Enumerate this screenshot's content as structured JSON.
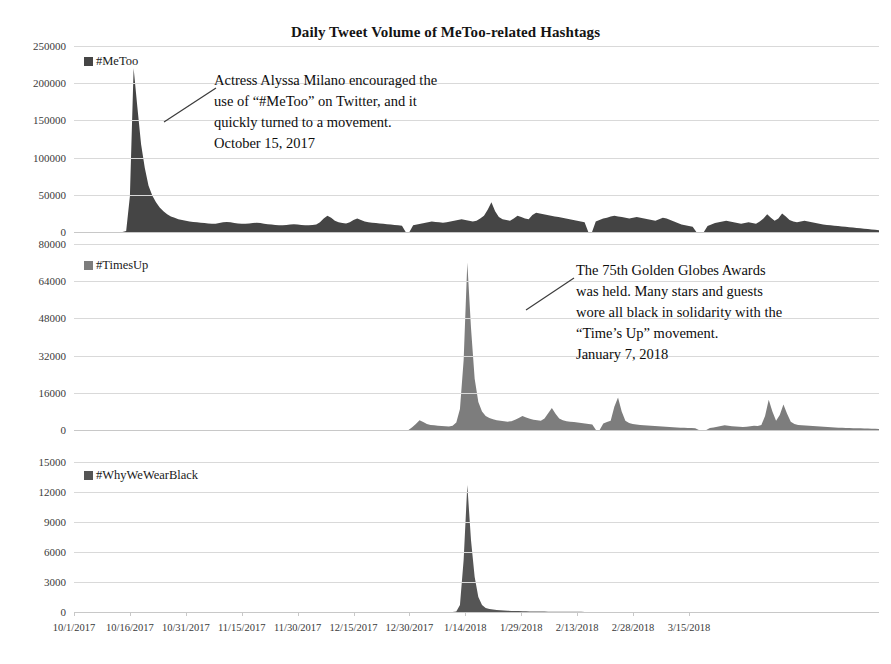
{
  "chart_data": {
    "type": "area",
    "title": "Daily Tweet Volume of MeToo-related Hashtags",
    "xlabel": "",
    "ylabel": "",
    "grid": true,
    "legend_position": "inside-top-left",
    "x_tick_labels": [
      "10/1/2017",
      "10/16/2017",
      "10/31/2017",
      "11/15/2017",
      "11/30/2017",
      "12/15/2017",
      "12/30/2017",
      "1/14/2018",
      "1/29/2018",
      "2/13/2018",
      "2/28/2018",
      "3/15/2018"
    ],
    "x_range": [
      "10/1/2017",
      "3/22/2018"
    ],
    "panels": [
      {
        "name": "#MeToo",
        "legend_label": "#MeToo",
        "color": "#454545",
        "ylim": [
          0,
          250000
        ],
        "y_tick_labels": [
          "250000",
          "200000",
          "150000",
          "100000",
          "50000",
          "0"
        ],
        "y_tick_values": [
          250000,
          200000,
          150000,
          100000,
          50000,
          0
        ],
        "peak_value": 220000,
        "peak_date": "10/16/2017",
        "values": [
          0,
          0,
          0,
          0,
          0,
          0,
          0,
          0,
          0,
          0,
          0,
          0,
          0,
          0,
          1500,
          48000,
          220000,
          168000,
          118000,
          86000,
          62000,
          49000,
          40000,
          33000,
          28000,
          24000,
          21000,
          19000,
          17000,
          16000,
          15000,
          14000,
          13500,
          13000,
          12500,
          12000,
          11500,
          11000,
          11000,
          12000,
          13000,
          13500,
          13000,
          12000,
          11500,
          11000,
          11000,
          11500,
          12000,
          12500,
          12000,
          11000,
          10500,
          10000,
          9500,
          9000,
          9000,
          9500,
          10000,
          10500,
          10000,
          9500,
          9000,
          9000,
          9500,
          10000,
          13000,
          18000,
          22000,
          19000,
          15000,
          13000,
          12000,
          11500,
          13000,
          16000,
          18000,
          16000,
          14000,
          13000,
          12500,
          12000,
          11500,
          11000,
          10500,
          10000,
          9500,
          9000,
          8500,
          0,
          0,
          9000,
          10000,
          11000,
          12000,
          13000,
          14000,
          13500,
          13000,
          12500,
          13000,
          14000,
          15000,
          16000,
          17000,
          16000,
          15000,
          14000,
          15000,
          18000,
          22000,
          30000,
          40000,
          28000,
          20000,
          17000,
          16000,
          15000,
          18000,
          22000,
          20000,
          18000,
          17000,
          23000,
          26000,
          25000,
          24000,
          23000,
          22000,
          21000,
          20000,
          19000,
          18000,
          17000,
          16000,
          15000,
          14000,
          13000,
          0,
          0,
          14000,
          16000,
          18000,
          19000,
          21000,
          22000,
          21000,
          20000,
          19000,
          18000,
          19000,
          20000,
          19000,
          18000,
          17000,
          16000,
          15000,
          17000,
          19000,
          18000,
          16000,
          14000,
          12000,
          10000,
          9000,
          8000,
          7000,
          0,
          0,
          0,
          8000,
          10000,
          12000,
          13000,
          14000,
          15000,
          14000,
          13000,
          12000,
          11000,
          12000,
          13000,
          12000,
          11000,
          14000,
          18000,
          24000,
          19000,
          15000,
          18000,
          25000,
          21000,
          16000,
          14000,
          13000,
          14000,
          15000,
          14000,
          13000,
          12000,
          11000,
          10000,
          9500,
          9000,
          8500,
          8000,
          7500,
          7000,
          6500,
          6000,
          5500,
          5000,
          4500,
          4000,
          3500,
          3000,
          2500
        ]
      },
      {
        "name": "#TimesUp",
        "legend_label": "#TimesUp",
        "color": "#7d7d7d",
        "ylim": [
          0,
          80000
        ],
        "y_tick_labels": [
          "80000",
          "64000",
          "48000",
          "32000",
          "16000",
          "0"
        ],
        "y_tick_values": [
          80000,
          64000,
          48000,
          32000,
          16000,
          0
        ],
        "peak_value": 72000,
        "peak_date": "1/7/2018",
        "values": [
          0,
          0,
          0,
          0,
          0,
          0,
          0,
          0,
          0,
          0,
          0,
          0,
          0,
          0,
          0,
          0,
          0,
          0,
          0,
          0,
          0,
          0,
          0,
          0,
          0,
          0,
          0,
          0,
          0,
          0,
          0,
          0,
          0,
          0,
          0,
          0,
          0,
          0,
          0,
          0,
          0,
          0,
          0,
          0,
          0,
          0,
          0,
          0,
          0,
          0,
          0,
          0,
          0,
          0,
          0,
          0,
          0,
          0,
          0,
          0,
          0,
          0,
          0,
          0,
          0,
          0,
          0,
          0,
          0,
          0,
          0,
          0,
          0,
          0,
          0,
          0,
          0,
          0,
          0,
          0,
          0,
          0,
          0,
          0,
          0,
          0,
          0,
          0,
          0,
          0,
          0,
          0,
          1200,
          2600,
          4200,
          3400,
          2600,
          2200,
          2000,
          1800,
          1700,
          1600,
          1500,
          1800,
          3200,
          9000,
          30000,
          72000,
          44000,
          22000,
          12000,
          8000,
          6000,
          5200,
          4600,
          4200,
          4000,
          3800,
          3600,
          3800,
          4400,
          5200,
          6000,
          5400,
          4800,
          4400,
          4200,
          4000,
          5000,
          7200,
          9500,
          7000,
          5000,
          4200,
          3800,
          3600,
          3400,
          3200,
          3000,
          2800,
          2600,
          2400,
          0,
          0,
          2800,
          3400,
          4000,
          10000,
          14000,
          8000,
          4000,
          3000,
          2600,
          2400,
          2200,
          2000,
          1900,
          1800,
          1700,
          1600,
          1500,
          1400,
          1300,
          1200,
          1100,
          1000,
          950,
          900,
          850,
          800,
          0,
          0,
          0,
          900,
          1100,
          1400,
          1700,
          2000,
          1800,
          1600,
          1500,
          1400,
          1300,
          1400,
          1600,
          1800,
          1700,
          2200,
          6000,
          13000,
          8000,
          4000,
          6500,
          11000,
          7000,
          3500,
          2600,
          2200,
          2000,
          1900,
          1800,
          1700,
          1600,
          1500,
          1400,
          1300,
          1200,
          1100,
          1000,
          950,
          900,
          850,
          800,
          750,
          700,
          650,
          600,
          550,
          500,
          450
        ]
      },
      {
        "name": "#WhyWeWearBlack",
        "legend_label": "#WhyWeWearBlack",
        "color": "#555555",
        "ylim": [
          0,
          15000
        ],
        "y_tick_labels": [
          "15000",
          "12000",
          "9000",
          "6000",
          "3000",
          "0"
        ],
        "y_tick_values": [
          15000,
          12000,
          9000,
          6000,
          3000,
          0
        ],
        "peak_value": 12700,
        "peak_date": "1/7/2018",
        "values": [
          0,
          0,
          0,
          0,
          0,
          0,
          0,
          0,
          0,
          0,
          0,
          0,
          0,
          0,
          0,
          0,
          0,
          0,
          0,
          0,
          0,
          0,
          0,
          0,
          0,
          0,
          0,
          0,
          0,
          0,
          0,
          0,
          0,
          0,
          0,
          0,
          0,
          0,
          0,
          0,
          0,
          0,
          0,
          0,
          0,
          0,
          0,
          0,
          0,
          0,
          0,
          0,
          0,
          0,
          0,
          0,
          0,
          0,
          0,
          0,
          0,
          0,
          0,
          0,
          0,
          0,
          0,
          0,
          0,
          0,
          0,
          0,
          0,
          0,
          0,
          0,
          0,
          0,
          0,
          0,
          0,
          0,
          0,
          0,
          0,
          0,
          0,
          0,
          0,
          0,
          0,
          0,
          0,
          0,
          0,
          0,
          0,
          0,
          0,
          0,
          0,
          0,
          0,
          0,
          60,
          700,
          5200,
          12700,
          7200,
          3500,
          1500,
          700,
          400,
          300,
          250,
          200,
          170,
          150,
          130,
          110,
          100,
          90,
          80,
          70,
          60,
          55,
          50,
          45,
          40,
          35,
          30,
          28,
          26,
          24,
          22,
          20,
          18,
          16,
          14,
          12,
          10,
          10,
          10,
          10,
          10,
          10,
          10,
          10,
          10,
          10,
          10,
          10,
          10,
          10,
          10,
          10,
          10,
          10,
          10,
          10,
          10,
          10,
          10,
          10,
          10,
          10,
          10,
          10,
          10,
          10,
          10,
          10,
          10,
          10,
          10,
          10,
          10,
          10,
          10,
          10,
          10,
          10,
          10,
          10,
          10,
          10,
          10,
          10,
          10,
          10,
          10,
          10,
          10,
          10,
          10,
          10,
          10,
          10,
          10,
          10,
          10,
          10,
          10,
          10,
          10,
          10,
          10,
          10,
          10,
          10,
          10,
          10,
          10,
          10,
          10,
          10,
          10,
          10,
          10,
          10
        ]
      }
    ],
    "annotations": [
      {
        "id": "metoo-annotation",
        "panel": 0,
        "text": "Actress Alyssa Milano encouraged the\nuse of “#MeToo” on Twitter, and it\nquickly turned to a movement.\nOctober 15, 2017",
        "date_line": "October 15, 2017"
      },
      {
        "id": "timesup-annotation",
        "panel": 1,
        "text": "The 75th Golden Globes Awards\nwas held. Many stars and guests\nwore all black in solidarity with the\n“Time’s Up” movement.\nJanuary 7, 2018",
        "date_line": "January 7, 2018"
      }
    ]
  },
  "colors": {
    "background": "#ffffff",
    "grid": "#d9d9d9",
    "axis": "#c8c8c8",
    "text": "#1a1a1a",
    "series_metoo": "#454545",
    "series_timesup": "#7d7d7d",
    "series_whywewearblack": "#555555"
  }
}
